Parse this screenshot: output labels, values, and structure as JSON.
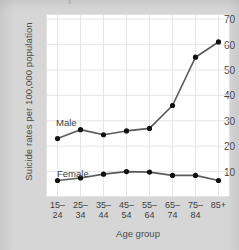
{
  "chart_data": {
    "type": "line",
    "title": "",
    "xlabel": "Age group",
    "ylabel": "Suicide rates per 100,000 population",
    "categories": [
      "15–24",
      "25–34",
      "35–44",
      "45–54",
      "55–64",
      "65–74",
      "75–84",
      "85+"
    ],
    "category_lines": [
      [
        "15–",
        "24"
      ],
      [
        "25–",
        "34"
      ],
      [
        "35–",
        "44"
      ],
      [
        "45–",
        "54"
      ],
      [
        "55–",
        "64"
      ],
      [
        "65–",
        "74"
      ],
      [
        "75–",
        "84"
      ],
      [
        "85+",
        ""
      ]
    ],
    "series": [
      {
        "name": "Male",
        "values": [
          23,
          26.5,
          24.5,
          26,
          27,
          36,
          55,
          61
        ]
      },
      {
        "name": "Female",
        "values": [
          6.5,
          7.5,
          9,
          10,
          9.8,
          8.5,
          8.5,
          6.5
        ]
      }
    ],
    "ylim": [
      0,
      72
    ],
    "yticks": [
      10,
      20,
      30,
      40,
      50,
      60,
      70
    ],
    "ytick_labels": [
      "10",
      "20",
      "30",
      "40",
      "50",
      "60",
      "70"
    ],
    "grid": true,
    "legend": "inline-labels",
    "colors": {
      "line": "#5a5a5a",
      "marker": "#111111",
      "plot_background": "#ffffff",
      "figure_background": "#d6d6d6",
      "gridline": "#e6e6e6",
      "text": "#3f3f3f"
    }
  }
}
